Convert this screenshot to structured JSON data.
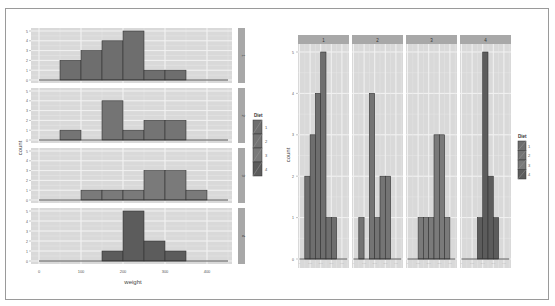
{
  "chart_data": [
    {
      "type": "bar",
      "subtype": "histogram",
      "layout": "facet_grid rows (Diet ~ .)",
      "title": "",
      "xlabel": "weight",
      "ylabel": "count",
      "xticks": [
        "0",
        "100",
        "200",
        "300",
        "400"
      ],
      "xlim": [
        0,
        450
      ],
      "yticks": [
        "0",
        "1",
        "2",
        "3",
        "4",
        "5"
      ],
      "ylim": [
        0,
        5
      ],
      "binwidth": 50,
      "bin_starts": [
        0,
        50,
        100,
        150,
        200,
        250,
        300,
        350,
        400
      ],
      "grid": true,
      "legend": {
        "title": "Diet",
        "entries": [
          "1",
          "2",
          "3",
          "4"
        ],
        "position": "right"
      },
      "series": [
        {
          "name": "1",
          "values": [
            0,
            2,
            3,
            4,
            5,
            1,
            1,
            0,
            0
          ]
        },
        {
          "name": "2",
          "values": [
            0,
            1,
            0,
            4,
            1,
            2,
            2,
            0,
            0
          ]
        },
        {
          "name": "3",
          "values": [
            0,
            0,
            1,
            1,
            1,
            3,
            3,
            1,
            0
          ]
        },
        {
          "name": "4",
          "values": [
            0,
            0,
            0,
            1,
            5,
            2,
            1,
            0,
            0
          ]
        }
      ]
    },
    {
      "type": "bar",
      "subtype": "histogram",
      "layout": "facet_grid columns (. ~ Diet)",
      "title": "",
      "xlabel": "",
      "ylabel": "count",
      "yticks": [
        "0",
        "1",
        "2",
        "3",
        "4",
        "5"
      ],
      "ylim": [
        0,
        5
      ],
      "binwidth": 50,
      "bin_starts": [
        0,
        50,
        100,
        150,
        200,
        250,
        300,
        350,
        400
      ],
      "grid": true,
      "strip_labels": [
        "1",
        "2",
        "3",
        "4"
      ],
      "legend": {
        "title": "Diet",
        "entries": [
          "1",
          "2",
          "3",
          "4"
        ],
        "position": "right"
      },
      "series": [
        {
          "name": "1",
          "values": [
            0,
            2,
            3,
            4,
            5,
            1,
            1,
            0,
            0
          ]
        },
        {
          "name": "2",
          "values": [
            0,
            1,
            0,
            4,
            1,
            2,
            2,
            0,
            0
          ]
        },
        {
          "name": "3",
          "values": [
            0,
            0,
            1,
            1,
            1,
            3,
            3,
            1,
            0
          ]
        },
        {
          "name": "4",
          "values": [
            0,
            0,
            0,
            1,
            5,
            2,
            1,
            0,
            0
          ]
        }
      ]
    }
  ],
  "colors": {
    "panel_bg": "#d9d9d9",
    "grid_major": "#f2f2f2",
    "grid_minor": "#e6e6e6",
    "strip_bg": "#a8a8a8",
    "bar_fill": [
      "#6e6e6e",
      "#747474",
      "#7a7a7a",
      "#5c5c5c"
    ],
    "bar_stroke": "#333333",
    "text": "#555555"
  }
}
